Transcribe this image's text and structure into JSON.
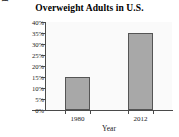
{
  "chart_data": {
    "type": "bar",
    "title": "Overweight Adults in U.S.",
    "xlabel": "Year",
    "ylabel": "Percent",
    "categories": [
      "1980",
      "2012"
    ],
    "values": [
      15,
      35
    ],
    "value_labels": [
      "15%",
      "35%"
    ],
    "ylim": [
      0,
      40
    ],
    "ytick_values": [
      0,
      5,
      10,
      15,
      20,
      25,
      30,
      35,
      40
    ],
    "ytick_labels": [
      "0%",
      "5%",
      "10%",
      "15%",
      "20%",
      "25%",
      "30%",
      "35%",
      "40%"
    ],
    "grid": false,
    "legend": false,
    "legend_position": "none",
    "series": [
      {
        "name": "Percent of overweight adults",
        "values": [
          15,
          35
        ]
      }
    ],
    "bar_fill_color": "#a8a8a8",
    "bar_edge_color": "#555555",
    "plot_background_color": "#fafafa",
    "figure_background_color": "#ffffff",
    "axis_color": "#4a4a4a",
    "text_color": "#1a1a1a"
  }
}
